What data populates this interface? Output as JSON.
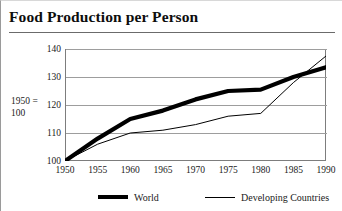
{
  "page_title": "Food Production per Person",
  "axis_caption_line1": "1950 =",
  "axis_caption_line2": "100",
  "legend": [
    {
      "label": "World",
      "style": "thick"
    },
    {
      "label": "Developing Countries",
      "style": "thin"
    }
  ],
  "colors": {
    "line": "#000000",
    "grid": "#9d9d9d",
    "frame": "#7d7d7d",
    "title_rule": "#6b6b6b",
    "background": "#ffffff"
  },
  "chart_data": {
    "type": "line",
    "title": "Food Production per Person",
    "xlabel": "",
    "ylabel": "1950 = 100",
    "x": [
      1950,
      1955,
      1960,
      1965,
      1970,
      1975,
      1980,
      1985,
      1990
    ],
    "xtick_labels": [
      "1950",
      "1955",
      "1960",
      "1965",
      "1970",
      "1975",
      "1980",
      "1985",
      "1990"
    ],
    "ytick_labels": [
      "100",
      "110",
      "120",
      "130",
      "140"
    ],
    "yticks": [
      100,
      110,
      120,
      130,
      140
    ],
    "xlim": [
      1950,
      1990
    ],
    "ylim": [
      100,
      140
    ],
    "grid": "horizontal",
    "legend_position": "bottom",
    "series": [
      {
        "name": "World",
        "style": "thick",
        "values": [
          100,
          108,
          115,
          118,
          122,
          125,
          125.5,
          130,
          133.5
        ]
      },
      {
        "name": "Developing Countries",
        "style": "thin",
        "values": [
          100,
          106,
          110,
          111,
          113,
          116,
          117,
          128,
          137.5
        ]
      }
    ]
  }
}
